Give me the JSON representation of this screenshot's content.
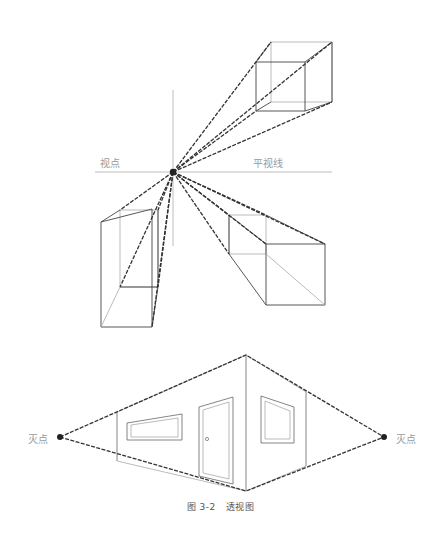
{
  "figure": {
    "type": "perspective-diagram",
    "top_diagram": {
      "labels": {
        "viewpoint": "视点",
        "horizon_line": "平视线"
      },
      "vanishing_point": [
        173,
        172
      ]
    },
    "bottom_diagram": {
      "labels": {
        "left_vanishing_point": "灭点",
        "right_vanishing_point": "灭点"
      },
      "left_vp": [
        60,
        437
      ],
      "right_vp": [
        384,
        437
      ]
    },
    "caption": {
      "number": "图 3-2",
      "title": "透视图"
    },
    "colors": {
      "line": "#333333",
      "guide": "#b5b5b5",
      "label": "#9a9a9a"
    }
  }
}
